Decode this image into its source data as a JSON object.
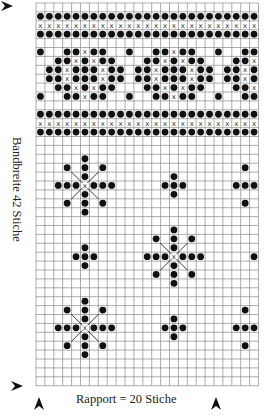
{
  "chart_data": {
    "type": "knitting-chart",
    "grid": {
      "columns": 25,
      "rows": 43,
      "left": 36,
      "top": 3,
      "cell": 8.9
    },
    "colors": {
      "grid_line": "#8a8a8a",
      "symbol": "#111111",
      "background": "#ffffff"
    },
    "legend": {
      "dot": "filled stitch",
      "x": "cross stitch"
    },
    "bands": [
      {
        "name": "top-border",
        "rows": {
          "1": "dots",
          "2": "x",
          "3": "dots"
        }
      },
      {
        "name": "bottom-border",
        "rows": {
          "12": "dots",
          "13": "x",
          "14": "dots"
        }
      }
    ],
    "band_pattern": {
      "repeat": 10,
      "rows": {
        "5": {
          "dot": [
            0,
            3,
            4,
            6,
            7
          ],
          "x": [
            5
          ]
        },
        "6": {
          "dot": [
            2,
            3,
            5,
            7,
            8
          ],
          "x": [
            4,
            6
          ]
        },
        "7": {
          "dot": [
            1,
            2,
            4,
            5,
            6,
            8,
            9
          ],
          "x": [
            3,
            7
          ]
        },
        "8": {
          "dot": [
            1,
            2,
            4,
            5,
            6,
            8,
            9
          ],
          "x": [
            3,
            7
          ]
        },
        "9": {
          "dot": [
            2,
            3,
            5,
            7,
            8
          ],
          "x": [
            4,
            6
          ]
        },
        "10": {
          "dot": [
            0,
            3,
            4,
            6,
            7
          ],
          "x": [
            5
          ]
        }
      }
    },
    "motifs": [
      {
        "type": "star",
        "col": 5,
        "row": 20
      },
      {
        "type": "diamond",
        "col": 15,
        "row": 20
      },
      {
        "type": "star",
        "col": 25,
        "row": 20
      },
      {
        "type": "diamond",
        "col": 5,
        "row": 28
      },
      {
        "type": "star",
        "col": 15,
        "row": 28
      },
      {
        "type": "diamond",
        "col": 25,
        "row": 28
      },
      {
        "type": "star",
        "col": 5,
        "row": 36
      },
      {
        "type": "diamond",
        "col": 15,
        "row": 36
      },
      {
        "type": "star",
        "col": 25,
        "row": 36
      }
    ],
    "annotations": {
      "side_label": "Bandbreite 42 Stiche",
      "bottom_label": "Rapport = 20 Stiche",
      "arrows": [
        {
          "name": "start-row-arrow-top",
          "direction": "right",
          "x": 13,
          "y": 6
        },
        {
          "name": "start-row-arrow-bottom",
          "direction": "right",
          "x": 23,
          "y": 386
        },
        {
          "name": "repeat-start-arrow",
          "direction": "up",
          "x": 39,
          "y": 403
        },
        {
          "name": "repeat-end-arrow",
          "direction": "up",
          "x": 216,
          "y": 403
        }
      ]
    }
  },
  "labels": {
    "side": "Bandbreite 42 Stiche",
    "bottom": "Rapport = 20 Stiche"
  }
}
